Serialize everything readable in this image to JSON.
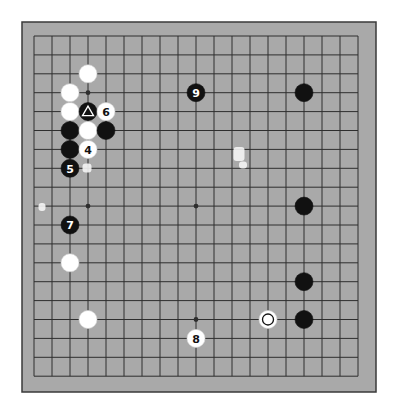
{
  "board": {
    "size": 19,
    "colors": {
      "background": "#ffffff",
      "board": "#a9a9a9",
      "frame": "#3a3a3a",
      "grid": "#2e2e2e",
      "black_stone": "#111111",
      "white_stone": "#ffffff",
      "label_on_black": "#ffffff",
      "label_on_white": "#111111"
    },
    "hoshi": [
      [
        3,
        3
      ],
      [
        9,
        3
      ],
      [
        15,
        3
      ],
      [
        3,
        9
      ],
      [
        9,
        9
      ],
      [
        15,
        9
      ],
      [
        3,
        15
      ],
      [
        9,
        15
      ],
      [
        15,
        15
      ]
    ],
    "stones": [
      {
        "col": 3,
        "row": 2,
        "color": "white",
        "label": ""
      },
      {
        "col": 2,
        "row": 3,
        "color": "white",
        "label": ""
      },
      {
        "col": 2,
        "row": 4,
        "color": "white",
        "label": ""
      },
      {
        "col": 3,
        "row": 4,
        "color": "black",
        "label": "",
        "marker": "triangle"
      },
      {
        "col": 4,
        "row": 4,
        "color": "white",
        "label": "6"
      },
      {
        "col": 2,
        "row": 5,
        "color": "black",
        "label": ""
      },
      {
        "col": 3,
        "row": 5,
        "color": "white",
        "label": ""
      },
      {
        "col": 4,
        "row": 5,
        "color": "black",
        "label": ""
      },
      {
        "col": 2,
        "row": 6,
        "color": "black",
        "label": ""
      },
      {
        "col": 3,
        "row": 6,
        "color": "white",
        "label": "4"
      },
      {
        "col": 2,
        "row": 7,
        "color": "black",
        "label": "5"
      },
      {
        "col": 9,
        "row": 3,
        "color": "black",
        "label": "9"
      },
      {
        "col": 15,
        "row": 3,
        "color": "black",
        "label": ""
      },
      {
        "col": 2,
        "row": 10,
        "color": "black",
        "label": "7"
      },
      {
        "col": 2,
        "row": 12,
        "color": "white",
        "label": ""
      },
      {
        "col": 15,
        "row": 9,
        "color": "black",
        "label": ""
      },
      {
        "col": 15,
        "row": 13,
        "color": "black",
        "label": ""
      },
      {
        "col": 3,
        "row": 15,
        "color": "white",
        "label": ""
      },
      {
        "col": 13,
        "row": 15,
        "color": "white",
        "label": "",
        "marker": "circle"
      },
      {
        "col": 15,
        "row": 15,
        "color": "black",
        "label": ""
      },
      {
        "col": 9,
        "row": 16,
        "color": "white",
        "label": "8"
      }
    ],
    "artifacts": [
      {
        "x": 87,
        "y": 168,
        "w": 9,
        "h": 9
      },
      {
        "x": 239,
        "y": 154,
        "w": 11,
        "h": 14
      },
      {
        "x": 243,
        "y": 165,
        "w": 8,
        "h": 7
      },
      {
        "x": 42,
        "y": 207,
        "w": 7,
        "h": 8
      }
    ]
  }
}
